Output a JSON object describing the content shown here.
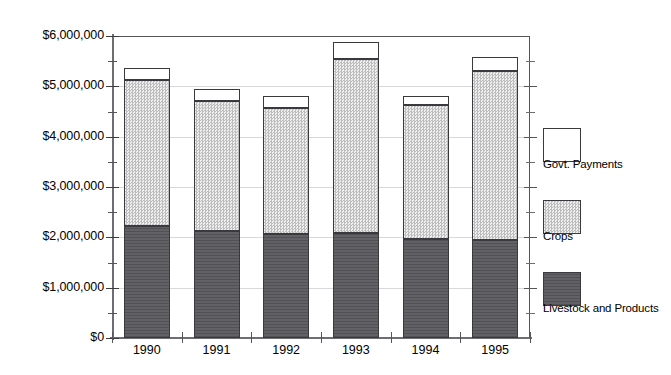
{
  "chart_data": {
    "type": "bar",
    "subtype": "stacked-bar",
    "title": "",
    "subtitle": "",
    "xlabel": "",
    "ylabel": "",
    "categories": [
      "1990",
      "1991",
      "1992",
      "1993",
      "1994",
      "1995"
    ],
    "series": [
      {
        "name": "Livestock and Products",
        "color": "#5a5a5e",
        "fill": "solid-dark-gray",
        "values": [
          2220000,
          2130000,
          2070000,
          2090000,
          1970000,
          1950000
        ]
      },
      {
        "name": "Crops",
        "color": "#d6d6d6",
        "fill": "light-gray-dotted-hatch",
        "values": [
          2910000,
          2580000,
          2500000,
          3450000,
          2660000,
          3360000
        ]
      },
      {
        "name": "Govt. Payments",
        "color": "#ffffff",
        "fill": "white-empty",
        "values": [
          230000,
          240000,
          240000,
          340000,
          180000,
          270000
        ]
      }
    ],
    "totals": [
      5360000,
      4950000,
      4810000,
      5880000,
      4810000,
      5580000
    ],
    "ylim": [
      0,
      6000000
    ],
    "y_major_ticks": [
      0,
      1000000,
      2000000,
      3000000,
      4000000,
      5000000,
      6000000
    ],
    "y_minor_tick_interval": 500000,
    "y_tick_labels": [
      "$0",
      "$1,000,000",
      "$2,000,000",
      "$3,000,000",
      "$4,000,000",
      "$5,000,000",
      "$6,000,000"
    ],
    "grid": true,
    "grid_axis": "y",
    "legend_position": "right",
    "legend": [
      {
        "label": "Govt. Payments"
      },
      {
        "label": "Crops"
      },
      {
        "label": "Livestock and Products"
      }
    ]
  },
  "axis": {
    "y_labels": [
      "$6,000,000",
      "$5,000,000",
      "$4,000,000",
      "$3,000,000",
      "$2,000,000",
      "$1,000,000",
      "$0"
    ],
    "x_labels": [
      "1990",
      "1991",
      "1992",
      "1993",
      "1994",
      "1995"
    ]
  },
  "legend": {
    "items": [
      {
        "label": "Govt. Payments",
        "swatch": "white-empty"
      },
      {
        "label": "Crops",
        "swatch": "light-gray-dotted-hatch"
      },
      {
        "label": "Livestock and Products",
        "swatch": "solid-dark-gray"
      }
    ]
  },
  "colors": {
    "govt_payments": "#ffffff",
    "crops": "#d6d6d6",
    "livestock": "#5a5a5e",
    "axis": "#55555a",
    "grid": "#d8d8dc",
    "outline": "#3a3a3e",
    "background": "#ffffff"
  }
}
